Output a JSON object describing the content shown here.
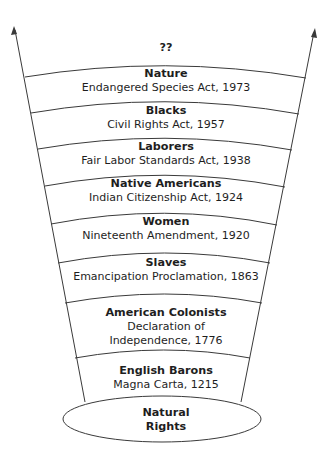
{
  "diagram": {
    "type": "expanding-circle-of-rights",
    "top_label": "??",
    "base": {
      "title": "Natural",
      "title2": "Rights"
    },
    "bands": [
      {
        "title": "Nature",
        "lines": [
          "Endangered Species Act, 1973"
        ]
      },
      {
        "title": "Blacks",
        "lines": [
          "Civil Rights Act, 1957"
        ]
      },
      {
        "title": "Laborers",
        "lines": [
          "Fair Labor Standards Act, 1938"
        ]
      },
      {
        "title": "Native Americans",
        "lines": [
          "Indian Citizenship Act, 1924"
        ]
      },
      {
        "title": "Women",
        "lines": [
          "Nineteenth Amendment, 1920"
        ]
      },
      {
        "title": "Slaves",
        "lines": [
          "Emancipation Proclamation, 1863"
        ]
      },
      {
        "title": "American Colonists",
        "lines": [
          "Declaration of",
          "Independence, 1776"
        ]
      },
      {
        "title": "English Barons",
        "lines": [
          "Magna Carta, 1215"
        ]
      }
    ],
    "colors": {
      "line": "#3a3a3a",
      "text": "#1e1e1e",
      "background": "#ffffff"
    }
  }
}
